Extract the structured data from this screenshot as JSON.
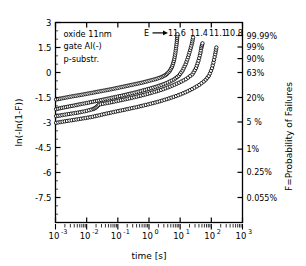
{
  "chart_data": {
    "type": "line",
    "title": "",
    "xlabel": "time [s]",
    "ylabel": "ln(-ln(1-F))",
    "ylabel_right": "F=Probability of Failures",
    "xscale": "log",
    "xlim": [
      0.001,
      1000
    ],
    "ylim": [
      -9,
      3
    ],
    "grid": false,
    "legend": "none",
    "xticks": [
      {
        "value": 0.001,
        "label": "10",
        "exp": "-3"
      },
      {
        "value": 0.01,
        "label": "10",
        "exp": "-2"
      },
      {
        "value": 0.1,
        "label": "10",
        "exp": "-1"
      },
      {
        "value": 1,
        "label": "10",
        "exp": "0"
      },
      {
        "value": 10,
        "label": "10",
        "exp": "1"
      },
      {
        "value": 100,
        "label": "10",
        "exp": "2"
      },
      {
        "value": 1000,
        "label": "10",
        "exp": "3"
      }
    ],
    "yticks": [
      {
        "value": 3,
        "label": "3"
      },
      {
        "value": 1.5,
        "label": "1.5"
      },
      {
        "value": 0,
        "label": "0"
      },
      {
        "value": -1.5,
        "label": "-1.5"
      },
      {
        "value": -3,
        "label": "-3"
      },
      {
        "value": -4.5,
        "label": "-4.5"
      },
      {
        "value": -6,
        "label": "-6"
      },
      {
        "value": -7.5,
        "label": "-7.5"
      }
    ],
    "yticks_right": [
      {
        "value": 2.22,
        "label": "99.99%"
      },
      {
        "value": 1.53,
        "label": "99%"
      },
      {
        "value": 0.834,
        "label": "90%"
      },
      {
        "value": 0.0,
        "label": "63%"
      },
      {
        "value": -1.5,
        "label": "20%"
      },
      {
        "value": -2.97,
        "label": "5 %"
      },
      {
        "value": -4.6,
        "label": "1%"
      },
      {
        "value": -5.99,
        "label": "0.25%"
      },
      {
        "value": -7.5,
        "label": "0.055%"
      }
    ],
    "annotations": [
      {
        "name": "oxide",
        "text": "oxide 11nm"
      },
      {
        "name": "gate",
        "text": "gate Al(-)"
      },
      {
        "name": "substrate",
        "text": "p-substr."
      }
    ],
    "field_label_prefix": "E",
    "field_arrow": "→",
    "series": [
      {
        "name": "E=11.6 MV/cm",
        "label": "11.6",
        "marker": "open-circle",
        "points": [
          [
            0.00105,
            -1.62
          ],
          [
            0.0016,
            -1.55
          ],
          [
            0.0025,
            -1.48
          ],
          [
            0.004,
            -1.41
          ],
          [
            0.0063,
            -1.35
          ],
          [
            0.01,
            -1.28
          ],
          [
            0.016,
            -1.21
          ],
          [
            0.025,
            -1.14
          ],
          [
            0.04,
            -1.07
          ],
          [
            0.063,
            -1.0
          ],
          [
            0.1,
            -0.92
          ],
          [
            0.16,
            -0.84
          ],
          [
            0.25,
            -0.76
          ],
          [
            0.4,
            -0.68
          ],
          [
            0.63,
            -0.6
          ],
          [
            1.0,
            -0.5
          ],
          [
            1.6,
            -0.4
          ],
          [
            2.5,
            -0.28
          ],
          [
            3.5,
            -0.14
          ],
          [
            4.6,
            0.08
          ],
          [
            5.6,
            0.38
          ],
          [
            6.4,
            0.75
          ],
          [
            7.0,
            1.15
          ],
          [
            7.5,
            1.55
          ],
          [
            7.9,
            1.95
          ],
          [
            8.2,
            2.3
          ]
        ]
      },
      {
        "name": "E=11.4 MV/cm",
        "label": "11.4",
        "marker": "open-circle",
        "points": [
          [
            0.00105,
            -2.2
          ],
          [
            0.0016,
            -2.12
          ],
          [
            0.0025,
            -2.05
          ],
          [
            0.004,
            -1.98
          ],
          [
            0.0063,
            -1.9
          ],
          [
            0.01,
            -1.83
          ],
          [
            0.016,
            -1.75
          ],
          [
            0.025,
            -1.68
          ],
          [
            0.04,
            -1.6
          ],
          [
            0.063,
            -1.52
          ],
          [
            0.1,
            -1.44
          ],
          [
            0.16,
            -1.36
          ],
          [
            0.25,
            -1.27
          ],
          [
            0.4,
            -1.18
          ],
          [
            0.63,
            -1.08
          ],
          [
            1.0,
            -0.98
          ],
          [
            1.6,
            -0.87
          ],
          [
            2.5,
            -0.75
          ],
          [
            4.0,
            -0.6
          ],
          [
            6.3,
            -0.42
          ],
          [
            9.0,
            -0.2
          ],
          [
            12.0,
            0.12
          ],
          [
            15.0,
            0.5
          ],
          [
            18.0,
            0.92
          ],
          [
            21.0,
            1.35
          ],
          [
            24.0,
            1.75
          ],
          [
            26.0,
            2.1
          ]
        ]
      },
      {
        "name": "E=11.1 MV/cm",
        "label": "11.1",
        "marker": "open-circle",
        "points": [
          [
            0.00105,
            -2.62
          ],
          [
            0.0016,
            -2.56
          ],
          [
            0.0025,
            -2.5
          ],
          [
            0.004,
            -2.44
          ],
          [
            0.0063,
            -2.38
          ],
          [
            0.01,
            -2.3
          ],
          [
            0.016,
            -2.2
          ],
          [
            0.02,
            -2.1
          ],
          [
            0.025,
            -1.92
          ],
          [
            0.04,
            -1.85
          ],
          [
            0.063,
            -1.78
          ],
          [
            0.1,
            -1.7
          ],
          [
            0.16,
            -1.62
          ],
          [
            0.25,
            -1.54
          ],
          [
            0.4,
            -1.45
          ],
          [
            0.63,
            -1.36
          ],
          [
            1.0,
            -1.26
          ],
          [
            1.6,
            -1.15
          ],
          [
            2.5,
            -1.04
          ],
          [
            4.0,
            -0.9
          ],
          [
            6.3,
            -0.75
          ],
          [
            10.0,
            -0.58
          ],
          [
            16.0,
            -0.38
          ],
          [
            25.0,
            -0.1
          ],
          [
            32.0,
            0.25
          ],
          [
            38.0,
            0.65
          ],
          [
            44.0,
            1.1
          ],
          [
            48.0,
            1.5
          ],
          [
            52.0,
            1.75
          ]
        ]
      },
      {
        "name": "E=10.8 MV/cm",
        "label": "10.8",
        "marker": "open-circle",
        "points": [
          [
            0.00105,
            -3.02
          ],
          [
            0.0016,
            -2.96
          ],
          [
            0.0025,
            -2.9
          ],
          [
            0.004,
            -2.84
          ],
          [
            0.0063,
            -2.78
          ],
          [
            0.01,
            -2.72
          ],
          [
            0.016,
            -2.65
          ],
          [
            0.025,
            -2.57
          ],
          [
            0.04,
            -2.48
          ],
          [
            0.063,
            -2.4
          ],
          [
            0.1,
            -2.32
          ],
          [
            0.16,
            -2.24
          ],
          [
            0.25,
            -2.16
          ],
          [
            0.4,
            -2.08
          ],
          [
            0.63,
            -1.99
          ],
          [
            1.0,
            -1.9
          ],
          [
            1.6,
            -1.8
          ],
          [
            2.5,
            -1.7
          ],
          [
            4.0,
            -1.58
          ],
          [
            6.3,
            -1.46
          ],
          [
            10.0,
            -1.32
          ],
          [
            16.0,
            -1.16
          ],
          [
            25.0,
            -0.98
          ],
          [
            40.0,
            -0.76
          ],
          [
            63.0,
            -0.48
          ],
          [
            85.0,
            -0.18
          ],
          [
            105.0,
            0.25
          ],
          [
            120.0,
            0.7
          ],
          [
            135.0,
            1.15
          ],
          [
            145.0,
            1.5
          ]
        ]
      }
    ]
  }
}
